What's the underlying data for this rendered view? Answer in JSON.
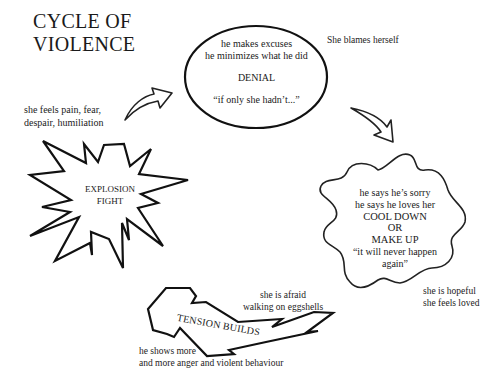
{
  "title": {
    "line1": "CYCLE OF",
    "line2": "VIOLENCE"
  },
  "stages": {
    "denial": {
      "shape": "ellipse",
      "lines": [
        "he makes excuses",
        "he minimizes what he did"
      ],
      "label": "DENIAL",
      "quote": "“if only she hadn’t...”",
      "side_note": "She blames herself"
    },
    "cool_down": {
      "shape": "cloud",
      "lines": [
        "he says he’s sorry",
        "he says he loves her"
      ],
      "label_line1": "COOL DOWN",
      "label_line2": "OR",
      "label_line3": "MAKE UP",
      "quote_line1": "“it will never happen",
      "quote_line2": "again”",
      "side_note_line1": "she is hopeful",
      "side_note_line2": "she feels loved"
    },
    "tension": {
      "shape": "zigzag-arrow",
      "label": "TENSION BUILDS",
      "top_note_line1": "she is afraid",
      "top_note_line2": "walking on eggshells",
      "bottom_note_line1": "he shows more",
      "bottom_note_line2": "and more anger and violent behaviour"
    },
    "explosion": {
      "shape": "starburst",
      "label_line1": "EXPLOSION",
      "label_line2": "FIGHT",
      "side_note_line1": "she feels pain, fear,",
      "side_note_line2": "despair, humiliation"
    }
  },
  "arrows": [
    {
      "name": "explosion-to-denial",
      "direction": "up-right"
    },
    {
      "name": "denial-to-cooldown",
      "direction": "down-right"
    }
  ]
}
